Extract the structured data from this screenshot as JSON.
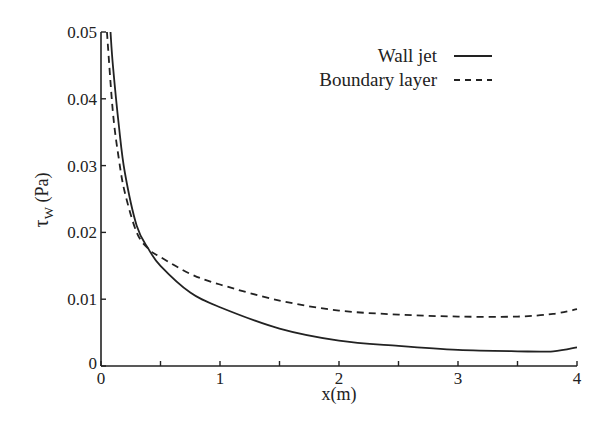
{
  "chart_data": {
    "type": "line",
    "title": "",
    "xlabel": "x(m)",
    "ylabel": "τw (Pa)",
    "ylabel_main": "τ",
    "ylabel_sub": "W",
    "ylabel_unit": " (Pa)",
    "xlim": [
      0,
      4
    ],
    "ylim": [
      0,
      0.05
    ],
    "grid": false,
    "legend_position": "upper right",
    "x_ticks": [
      "0",
      "1",
      "2",
      "3",
      "4"
    ],
    "y_ticks": [
      "0",
      "0.01",
      "0.02",
      "0.03",
      "0.04",
      "0.05"
    ],
    "series": [
      {
        "name": "Wall jet",
        "style": "solid",
        "x": [
          0.08,
          0.1,
          0.15,
          0.2,
          0.3,
          0.4,
          0.5,
          0.75,
          1.0,
          1.5,
          2.0,
          2.5,
          3.0,
          3.5,
          3.8,
          4.0
        ],
        "values": [
          0.05,
          0.045,
          0.036,
          0.029,
          0.021,
          0.0175,
          0.015,
          0.011,
          0.0088,
          0.0056,
          0.0038,
          0.003,
          0.0024,
          0.0022,
          0.0022,
          0.0028
        ]
      },
      {
        "name": "Boundary layer",
        "style": "dashed",
        "x": [
          0.05,
          0.1,
          0.15,
          0.2,
          0.3,
          0.4,
          0.5,
          0.75,
          1.0,
          1.5,
          2.0,
          2.5,
          3.0,
          3.5,
          3.8,
          4.0
        ],
        "values": [
          0.05,
          0.038,
          0.031,
          0.026,
          0.02,
          0.0175,
          0.0163,
          0.0138,
          0.0122,
          0.0098,
          0.0083,
          0.0077,
          0.0074,
          0.0074,
          0.0078,
          0.0085
        ]
      }
    ]
  }
}
